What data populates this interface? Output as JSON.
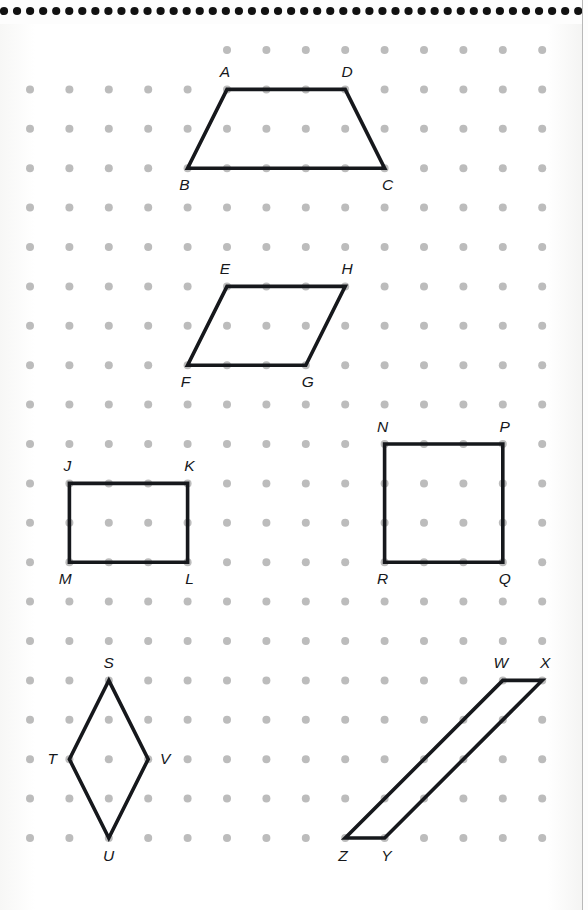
{
  "page": {
    "background_color": "#fdfdfd",
    "ink_color": "#16181c",
    "dot_color": "#bcbcbc",
    "binding_dot_color": "#111111",
    "page_edge_color": "#b9b9b9"
  },
  "binding": {
    "name": "spiral-binding-dots",
    "dot_count": 45,
    "dot_radius": 4.1,
    "start_x": 4,
    "spacing_x": 13.05,
    "center_y": 11
  },
  "grid": {
    "name": "dot-grid",
    "origin_x": 30,
    "origin_y": 50,
    "spacing_x": 39.4,
    "spacing_y": 39.4,
    "columns": 14,
    "rows": 21,
    "dot_radius": 4.0,
    "first_row_start_column": 5
  },
  "shapes": [
    {
      "name": "trapezoid-abcd",
      "kind": "trapezoid",
      "stroke_width": 3.6,
      "vertices": [
        {
          "label": "A",
          "gx": 5,
          "gy": 1,
          "label_dx": -2,
          "label_dy": -17
        },
        {
          "label": "D",
          "gx": 8,
          "gy": 1,
          "label_dx": 2,
          "label_dy": -17
        },
        {
          "label": "C",
          "gx": 9,
          "gy": 3,
          "label_dx": 3,
          "label_dy": 17
        },
        {
          "label": "B",
          "gx": 4,
          "gy": 3,
          "label_dx": -3,
          "label_dy": 17
        }
      ]
    },
    {
      "name": "parallelogram-ehgf",
      "kind": "parallelogram",
      "stroke_width": 3.6,
      "vertices": [
        {
          "label": "E",
          "gx": 5,
          "gy": 6,
          "label_dx": -2,
          "label_dy": -17
        },
        {
          "label": "H",
          "gx": 8,
          "gy": 6,
          "label_dx": 2,
          "label_dy": -17
        },
        {
          "label": "G",
          "gx": 7,
          "gy": 8,
          "label_dx": 2,
          "label_dy": 17
        },
        {
          "label": "F",
          "gx": 4,
          "gy": 8,
          "label_dx": -2,
          "label_dy": 17
        }
      ]
    },
    {
      "name": "rectangle-jklm",
      "kind": "rectangle",
      "stroke_width": 3.6,
      "vertices": [
        {
          "label": "J",
          "gx": 1,
          "gy": 11,
          "label_dx": -2,
          "label_dy": -17
        },
        {
          "label": "K",
          "gx": 4,
          "gy": 11,
          "label_dx": 2,
          "label_dy": -17
        },
        {
          "label": "L",
          "gx": 4,
          "gy": 13,
          "label_dx": 2,
          "label_dy": 17
        },
        {
          "label": "M",
          "gx": 1,
          "gy": 13,
          "label_dx": -4,
          "label_dy": 17
        }
      ]
    },
    {
      "name": "square-npqr",
      "kind": "square",
      "stroke_width": 3.6,
      "vertices": [
        {
          "label": "N",
          "gx": 9,
          "gy": 10,
          "label_dx": -2,
          "label_dy": -17
        },
        {
          "label": "P",
          "gx": 12,
          "gy": 10,
          "label_dx": 2,
          "label_dy": -17
        },
        {
          "label": "Q",
          "gx": 12,
          "gy": 13,
          "label_dx": 2,
          "label_dy": 17
        },
        {
          "label": "R",
          "gx": 9,
          "gy": 13,
          "label_dx": -2,
          "label_dy": 17
        }
      ]
    },
    {
      "name": "rhombus-stuv",
      "kind": "rhombus",
      "stroke_width": 3.6,
      "vertices": [
        {
          "label": "S",
          "gx": 2,
          "gy": 16,
          "label_dx": 0,
          "label_dy": -17
        },
        {
          "label": "V",
          "gx": 3,
          "gy": 18,
          "label_dx": 17,
          "label_dy": 0
        },
        {
          "label": "U",
          "gx": 2,
          "gy": 20,
          "label_dx": 0,
          "label_dy": 18
        },
        {
          "label": "T",
          "gx": 1,
          "gy": 18,
          "label_dx": -17,
          "label_dy": 0
        }
      ]
    },
    {
      "name": "parallelogram-wxyz",
      "kind": "parallelogram",
      "stroke_width": 3.6,
      "vertices": [
        {
          "label": "W",
          "gx": 12,
          "gy": 16,
          "label_dx": -2,
          "label_dy": -17
        },
        {
          "label": "X",
          "gx": 13,
          "gy": 16,
          "label_dx": 3,
          "label_dy": -17
        },
        {
          "label": "Y",
          "gx": 9,
          "gy": 20,
          "label_dx": 2,
          "label_dy": 18
        },
        {
          "label": "Z",
          "gx": 8,
          "gy": 20,
          "label_dx": -2,
          "label_dy": 18
        }
      ]
    }
  ],
  "labels_all": [
    "A",
    "B",
    "C",
    "D",
    "E",
    "F",
    "G",
    "H",
    "J",
    "K",
    "L",
    "M",
    "N",
    "P",
    "Q",
    "R",
    "S",
    "T",
    "U",
    "V",
    "W",
    "X",
    "Y",
    "Z"
  ]
}
